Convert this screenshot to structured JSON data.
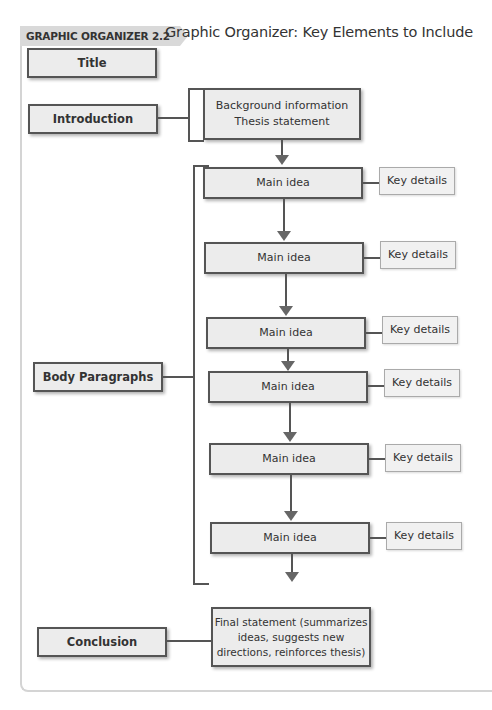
{
  "header": {
    "badge": "GRAPHIC ORGANIZER 2.2",
    "title": "Graphic Organizer: Key Elements to Include"
  },
  "sections": {
    "title": "Title",
    "introduction": "Introduction",
    "body": "Body Paragraphs",
    "conclusion": "Conclusion"
  },
  "introduction_box": {
    "line1": "Background information",
    "line2": "Thesis statement"
  },
  "body_rows": [
    {
      "main": "Main idea",
      "detail": "Key details"
    },
    {
      "main": "Main idea",
      "detail": "Key details"
    },
    {
      "main": "Main idea",
      "detail": "Key details"
    },
    {
      "main": "Main idea",
      "detail": "Key details"
    },
    {
      "main": "Main idea",
      "detail": "Key details"
    },
    {
      "main": "Main idea",
      "detail": "Key details"
    }
  ],
  "conclusion_box": {
    "line1": "Final statement (summarizes",
    "line2": "ideas, suggests new",
    "line3": "directions, reinforces thesis)"
  }
}
